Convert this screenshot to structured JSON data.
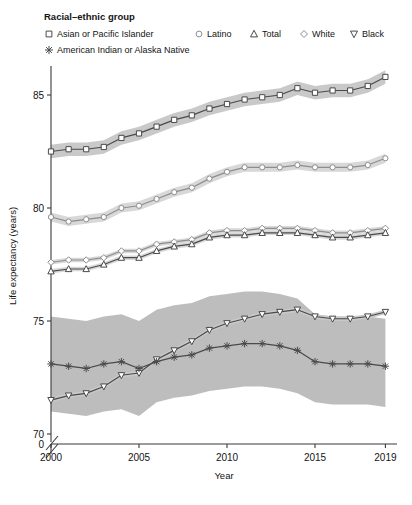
{
  "legend": {
    "title": "Racial–ethnic group",
    "entries": [
      {
        "label": "Asian or Pacific Islander",
        "marker": "square",
        "color": "#4a4a4a",
        "row": 0
      },
      {
        "label": "Latino",
        "marker": "circle",
        "color": "#8d8d8d",
        "row": 0
      },
      {
        "label": "Total",
        "marker": "triangle-up",
        "color": "#4a4a4a",
        "row": 0
      },
      {
        "label": "White",
        "marker": "diamond",
        "color": "#8d8d8d",
        "row": 0
      },
      {
        "label": "Black",
        "marker": "triangle-down",
        "color": "#4a4a4a",
        "row": 0
      },
      {
        "label": "American Indian or Alaska Native",
        "marker": "star",
        "color": "#4a4a4a",
        "row": 1
      }
    ]
  },
  "axes": {
    "x": {
      "title": "Year",
      "ticks": [
        2000,
        2005,
        2010,
        2015,
        2019
      ],
      "tick_labels": [
        "2000",
        "2005",
        "2010",
        "2015",
        "2019"
      ],
      "min": 2000,
      "max": 2019
    },
    "y": {
      "title": "Life expectancy (years)",
      "ticks": [
        70,
        75,
        80,
        85
      ],
      "tick_labels": [
        "70",
        "75",
        "80",
        "85"
      ],
      "zero_label": "0",
      "min": 69.2,
      "max": 86.6,
      "axis_break": true
    }
  },
  "chart_data": {
    "type": "line",
    "title": "",
    "xlabel": "Year",
    "ylabel": "Life expectancy (years)",
    "xlim": [
      2000,
      2019
    ],
    "ylim": [
      69.2,
      86.6
    ],
    "grid": false,
    "legend_position": "top-left",
    "x": [
      2000,
      2001,
      2002,
      2003,
      2004,
      2005,
      2006,
      2007,
      2008,
      2009,
      2010,
      2011,
      2012,
      2013,
      2014,
      2015,
      2016,
      2017,
      2018,
      2019
    ],
    "series": [
      {
        "name": "Asian or Pacific Islander",
        "marker": "square",
        "color": "#4a4a4a",
        "band_color": "#c9c9c9",
        "values": [
          82.5,
          82.6,
          82.6,
          82.7,
          83.1,
          83.3,
          83.6,
          83.9,
          84.1,
          84.4,
          84.6,
          84.8,
          84.9,
          85.0,
          85.3,
          85.1,
          85.2,
          85.2,
          85.4,
          85.8
        ],
        "lower": [
          82.2,
          82.3,
          82.3,
          82.4,
          82.8,
          83.0,
          83.3,
          83.6,
          83.8,
          84.1,
          84.3,
          84.5,
          84.6,
          84.7,
          85.0,
          84.8,
          84.9,
          84.9,
          85.1,
          85.5
        ],
        "upper": [
          82.8,
          82.9,
          82.9,
          83.0,
          83.4,
          83.6,
          83.9,
          84.2,
          84.4,
          84.7,
          84.9,
          85.1,
          85.2,
          85.3,
          85.6,
          85.4,
          85.5,
          85.5,
          85.7,
          86.1
        ]
      },
      {
        "name": "Latino",
        "marker": "circle",
        "color": "#8d8d8d",
        "band_color": "#d8d8d8",
        "values": [
          79.6,
          79.4,
          79.5,
          79.6,
          80.0,
          80.1,
          80.4,
          80.7,
          80.9,
          81.3,
          81.6,
          81.8,
          81.8,
          81.8,
          81.9,
          81.8,
          81.8,
          81.8,
          81.9,
          82.2
        ],
        "lower": [
          79.4,
          79.2,
          79.3,
          79.4,
          79.8,
          79.9,
          80.2,
          80.5,
          80.7,
          81.1,
          81.4,
          81.6,
          81.6,
          81.6,
          81.7,
          81.6,
          81.6,
          81.6,
          81.7,
          82.0
        ],
        "upper": [
          79.8,
          79.6,
          79.7,
          79.8,
          80.2,
          80.3,
          80.6,
          80.9,
          81.1,
          81.5,
          81.8,
          82.0,
          82.0,
          82.0,
          82.1,
          82.0,
          82.0,
          82.0,
          82.1,
          82.4
        ]
      },
      {
        "name": "White",
        "marker": "diamond",
        "color": "#8d8d8d",
        "band_color": "#d8d8d8",
        "values": [
          77.6,
          77.7,
          77.7,
          77.8,
          78.1,
          78.1,
          78.4,
          78.5,
          78.6,
          78.9,
          79.0,
          79.0,
          79.1,
          79.1,
          79.1,
          79.0,
          78.9,
          78.9,
          79.0,
          79.1
        ],
        "lower": [
          77.5,
          77.6,
          77.6,
          77.7,
          78.0,
          78.0,
          78.3,
          78.4,
          78.5,
          78.8,
          78.9,
          78.9,
          79.0,
          79.0,
          79.0,
          78.9,
          78.8,
          78.8,
          78.9,
          79.0
        ],
        "upper": [
          77.7,
          77.8,
          77.8,
          77.9,
          78.2,
          78.2,
          78.5,
          78.6,
          78.7,
          79.0,
          79.1,
          79.1,
          79.2,
          79.2,
          79.2,
          79.1,
          79.0,
          79.0,
          79.1,
          79.2
        ]
      },
      {
        "name": "Total",
        "marker": "triangle-up",
        "color": "#4a4a4a",
        "band_color": "#d8d8d8",
        "values": [
          77.2,
          77.3,
          77.3,
          77.5,
          77.8,
          77.8,
          78.1,
          78.3,
          78.4,
          78.7,
          78.8,
          78.8,
          78.9,
          78.9,
          78.9,
          78.8,
          78.7,
          78.7,
          78.8,
          78.9
        ],
        "lower": [
          77.1,
          77.2,
          77.2,
          77.4,
          77.7,
          77.7,
          78.0,
          78.2,
          78.3,
          78.6,
          78.7,
          78.7,
          78.8,
          78.8,
          78.8,
          78.7,
          78.6,
          78.6,
          78.7,
          78.8
        ],
        "upper": [
          77.3,
          77.4,
          77.4,
          77.6,
          77.9,
          77.9,
          78.2,
          78.4,
          78.5,
          78.8,
          78.9,
          78.9,
          79.0,
          79.0,
          79.0,
          78.9,
          78.8,
          78.8,
          78.9,
          79.0
        ]
      },
      {
        "name": "Black",
        "marker": "triangle-down",
        "color": "#4a4a4a",
        "band_color": "#c9c9c9",
        "values": [
          71.5,
          71.7,
          71.8,
          72.1,
          72.6,
          72.7,
          73.3,
          73.7,
          74.1,
          74.6,
          74.9,
          75.1,
          75.3,
          75.4,
          75.5,
          75.2,
          75.1,
          75.1,
          75.2,
          75.4
        ],
        "lower": [
          71.4,
          71.6,
          71.7,
          72.0,
          72.5,
          72.6,
          73.2,
          73.6,
          74.0,
          74.5,
          74.8,
          75.0,
          75.2,
          75.3,
          75.4,
          75.1,
          75.0,
          75.0,
          75.1,
          75.3
        ],
        "upper": [
          71.6,
          71.8,
          71.9,
          72.2,
          72.7,
          72.8,
          73.4,
          73.8,
          74.2,
          74.7,
          75.0,
          75.2,
          75.4,
          75.5,
          75.6,
          75.3,
          75.2,
          75.2,
          75.3,
          75.5
        ]
      },
      {
        "name": "American Indian or Alaska Native",
        "marker": "star",
        "color": "#4a4a4a",
        "band_color": "#bdbdbd",
        "values": [
          73.1,
          73.0,
          72.9,
          73.1,
          73.2,
          72.9,
          73.2,
          73.4,
          73.5,
          73.8,
          73.9,
          74.0,
          74.0,
          73.9,
          73.7,
          73.2,
          73.1,
          73.1,
          73.1,
          73.0
        ],
        "lower": [
          71.0,
          70.9,
          70.8,
          71.0,
          71.1,
          70.8,
          71.4,
          71.6,
          71.7,
          71.9,
          72.0,
          72.1,
          72.1,
          72.0,
          71.8,
          71.4,
          71.3,
          71.3,
          71.3,
          71.2
        ],
        "upper": [
          75.2,
          75.1,
          75.0,
          75.2,
          75.3,
          75.0,
          75.5,
          75.7,
          75.8,
          76.1,
          76.2,
          76.3,
          76.3,
          76.2,
          76.0,
          75.3,
          75.2,
          75.2,
          75.2,
          75.1
        ]
      }
    ]
  }
}
